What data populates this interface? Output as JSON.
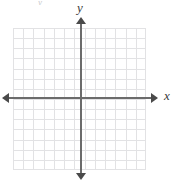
{
  "figure": {
    "type": "coordinate-plane",
    "title": "",
    "axis_labels": {
      "x": "x",
      "y": "y"
    },
    "top_artifact": "y",
    "colors": {
      "background": "#ffffff",
      "grid_line": "#e2e2e4",
      "axis_line": "#6b6b6b",
      "arrow_head": "#4a4a4a",
      "label_text": "#3a3a3a"
    }
  },
  "chart_data": {
    "type": "scatter",
    "title": "",
    "xlabel": "x",
    "ylabel": "y",
    "grid": true,
    "legend": null,
    "series": [],
    "x": [],
    "values": [],
    "annotations": [],
    "xlim": [
      -7,
      6
    ],
    "ylim": [
      -7,
      7
    ],
    "xticks": [],
    "yticks": [],
    "tick_labels_visible": false,
    "grid_columns": 13,
    "grid_rows": 14,
    "cell_size_px": 10,
    "origin_px": {
      "x": 81,
      "y": 98
    },
    "axis_arrows": [
      "left",
      "right",
      "up",
      "down"
    ]
  }
}
